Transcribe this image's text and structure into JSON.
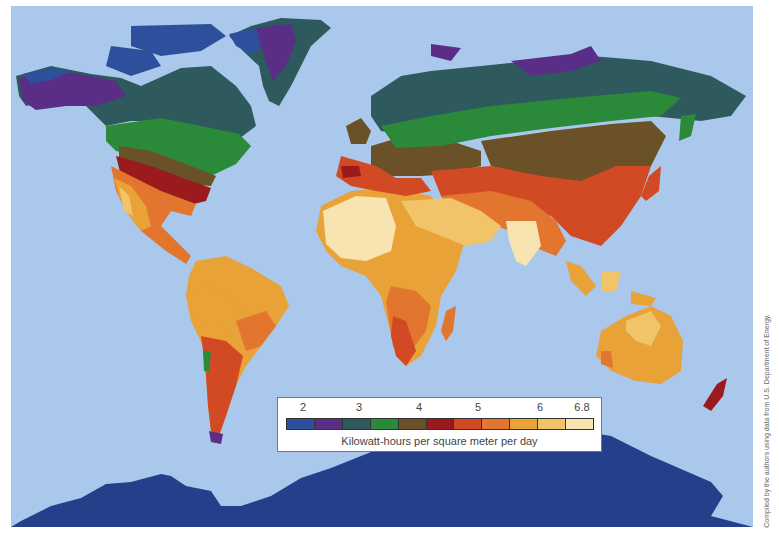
{
  "map": {
    "title": "World solar insolation map",
    "ocean_color": "#a9c8ec",
    "regions": [
      {
        "name": "north-america",
        "note": "colored by insolation zones"
      },
      {
        "name": "south-america"
      },
      {
        "name": "europe"
      },
      {
        "name": "africa"
      },
      {
        "name": "asia"
      },
      {
        "name": "australia"
      },
      {
        "name": "new-zealand"
      },
      {
        "name": "greenland"
      },
      {
        "name": "antarctica"
      }
    ]
  },
  "legend": {
    "ticks": [
      {
        "label": "2",
        "x": 25
      },
      {
        "label": "3",
        "x": 81
      },
      {
        "label": "4",
        "x": 141
      },
      {
        "label": "5",
        "x": 200
      },
      {
        "label": "6",
        "x": 262
      },
      {
        "label": "6.8",
        "x": 304
      }
    ],
    "swatches": [
      "#2e4f9c",
      "#5a2d86",
      "#2e5a5e",
      "#2a8a3a",
      "#6a5128",
      "#9a1a1e",
      "#d24a24",
      "#e2762e",
      "#e8a238",
      "#f1c46a",
      "#f7e4b0"
    ],
    "caption": "Kilowatt-hours per square meter per day"
  },
  "credit": "Compiled by the authors using data from U.S. Department of Energy."
}
